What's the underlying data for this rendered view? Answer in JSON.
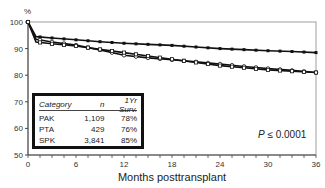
{
  "chart_data": {
    "type": "line",
    "title": "",
    "xlabel": "Months posttransplant",
    "ylabel": "%",
    "xlim": [
      0,
      36
    ],
    "ylim": [
      50,
      100
    ],
    "x_ticks": [
      0,
      6,
      12,
      18,
      24,
      30,
      36
    ],
    "y_ticks": [
      50,
      60,
      70,
      80,
      90,
      100
    ],
    "grid": false,
    "x": [
      0,
      1,
      3,
      6,
      9,
      12,
      15,
      18,
      21,
      24,
      27,
      30,
      33,
      36
    ],
    "series": [
      {
        "name": "SPK",
        "marker": "filled-square",
        "values": [
          100,
          94.5,
          94,
          93.3,
          92.6,
          92,
          91.6,
          91.2,
          90.6,
          90,
          89.6,
          89.2,
          88.9,
          88.5
        ]
      },
      {
        "name": "PAK",
        "marker": "open-circle",
        "values": [
          100,
          93.5,
          92.5,
          91.3,
          89.5,
          87.5,
          86.5,
          85.8,
          85,
          84.2,
          83.3,
          82.5,
          81.8,
          81
        ]
      },
      {
        "name": "PTA",
        "marker": "open-square",
        "values": [
          100,
          92.5,
          91.8,
          91,
          89.7,
          88.5,
          87.2,
          86,
          84.8,
          83.6,
          82.8,
          82,
          81.5,
          81
        ]
      }
    ],
    "legend": {
      "position": "inside-lower-left",
      "columns": [
        "Category",
        "n",
        "1Yr Surv."
      ],
      "rows": [
        {
          "category": "PAK",
          "n": "1,109",
          "surv": "78%"
        },
        {
          "category": "PTA",
          "n": "429",
          "surv": "76%"
        },
        {
          "category": "SPK",
          "n": "3,841",
          "surv": "85%"
        }
      ]
    },
    "annotations": [
      {
        "text": "P ≤ 0.0001",
        "position": "lower-right"
      }
    ]
  },
  "labels": {
    "y_unit": "%",
    "x_title": "Months posttransplant",
    "p_prefix": "P",
    "p_value": " ≤ 0.0001"
  }
}
